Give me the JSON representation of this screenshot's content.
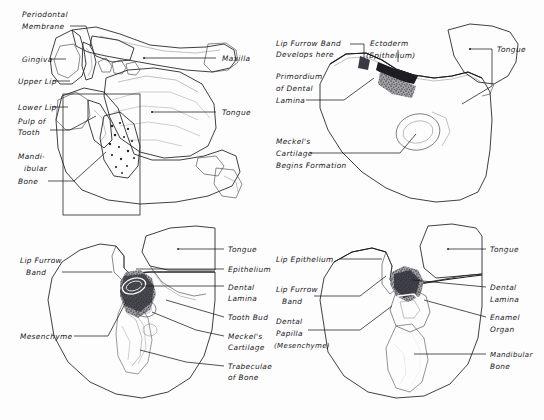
{
  "figure": {
    "background_color": "#fdfdfd",
    "ink_color": "#1b1b20",
    "tissue_fill": "#b9b9bb",
    "panel_count": 4
  },
  "panels": [
    {
      "id": "panel-top-left",
      "name": "sagittal-section-of-head",
      "labels_left": [
        {
          "text": "Periodontal",
          "x": 22,
          "y": 17
        },
        {
          "text": "Membrane",
          "x": 22,
          "y": 29
        },
        {
          "text": "Gingiva",
          "x": 22,
          "y": 62
        },
        {
          "text": "Upper Lip",
          "x": 18,
          "y": 84
        },
        {
          "text": "Lower Lip",
          "x": 18,
          "y": 110
        },
        {
          "text": "Pulp of",
          "x": 18,
          "y": 124
        },
        {
          "text": "Tooth",
          "x": 18,
          "y": 135
        },
        {
          "text": "Mandi-",
          "x": 18,
          "y": 159
        },
        {
          "text": "ibular",
          "x": 24,
          "y": 171
        },
        {
          "text": "Bone",
          "x": 18,
          "y": 184
        }
      ],
      "labels_right": [
        {
          "text": "Maxilla",
          "x": 222,
          "y": 61
        },
        {
          "text": "Tongue",
          "x": 222,
          "y": 115
        }
      ]
    },
    {
      "id": "panel-top-right",
      "name": "primordium-of-dental-lamina-stage",
      "labels_left": [
        {
          "text": "Lip Furrow Band",
          "x": 276,
          "y": 46
        },
        {
          "text": "Develops here",
          "x": 276,
          "y": 57
        },
        {
          "text": "Primordium",
          "x": 276,
          "y": 79
        },
        {
          "text": "of Dental",
          "x": 276,
          "y": 91
        },
        {
          "text": "Lamina",
          "x": 276,
          "y": 103
        },
        {
          "text": "Meckel's",
          "x": 276,
          "y": 144
        },
        {
          "text": "Cartilage",
          "x": 276,
          "y": 156
        },
        {
          "text": "Begins Formation",
          "x": 276,
          "y": 168
        }
      ],
      "labels_top": [
        {
          "text": "Ectoderm",
          "x": 370,
          "y": 46
        },
        {
          "text": "(Epithelium)",
          "x": 366,
          "y": 58
        }
      ],
      "labels_right": [
        {
          "text": "Tongue",
          "x": 497,
          "y": 52
        }
      ]
    },
    {
      "id": "panel-bottom-left",
      "name": "tooth-bud-stage",
      "labels_left": [
        {
          "text": "Lip Furrow",
          "x": 20,
          "y": 263
        },
        {
          "text": "Band",
          "x": 26,
          "y": 275
        },
        {
          "text": "Mesenchyme",
          "x": 20,
          "y": 339
        }
      ],
      "labels_right": [
        {
          "text": "Tongue",
          "x": 228,
          "y": 252
        },
        {
          "text": "Epithelium",
          "x": 228,
          "y": 272
        },
        {
          "text": "Dental",
          "x": 228,
          "y": 290
        },
        {
          "text": "Lamina",
          "x": 228,
          "y": 301
        },
        {
          "text": "Tooth Bud",
          "x": 228,
          "y": 320
        },
        {
          "text": "Meckel's",
          "x": 228,
          "y": 339
        },
        {
          "text": "Cartilage",
          "x": 228,
          "y": 350
        },
        {
          "text": "Trabeculae",
          "x": 228,
          "y": 369
        },
        {
          "text": "of Bone",
          "x": 228,
          "y": 380
        }
      ]
    },
    {
      "id": "panel-bottom-right",
      "name": "enamel-organ-cap-stage",
      "labels_left": [
        {
          "text": "Lip Epithelium",
          "x": 276,
          "y": 262
        },
        {
          "text": "Lip Furrow",
          "x": 276,
          "y": 292
        },
        {
          "text": "Band",
          "x": 282,
          "y": 304
        },
        {
          "text": "Dental",
          "x": 276,
          "y": 324
        },
        {
          "text": "Papilla",
          "x": 276,
          "y": 336
        },
        {
          "text": "(Mesenchyme)",
          "x": 274,
          "y": 348
        }
      ],
      "labels_right": [
        {
          "text": "Tongue",
          "x": 490,
          "y": 252
        },
        {
          "text": "Dental",
          "x": 490,
          "y": 290
        },
        {
          "text": "Lamina",
          "x": 490,
          "y": 302
        },
        {
          "text": "Enamel",
          "x": 490,
          "y": 320
        },
        {
          "text": "Organ",
          "x": 490,
          "y": 332
        },
        {
          "text": "Mandibular",
          "x": 490,
          "y": 357
        },
        {
          "text": "Bone",
          "x": 490,
          "y": 369
        }
      ]
    }
  ]
}
